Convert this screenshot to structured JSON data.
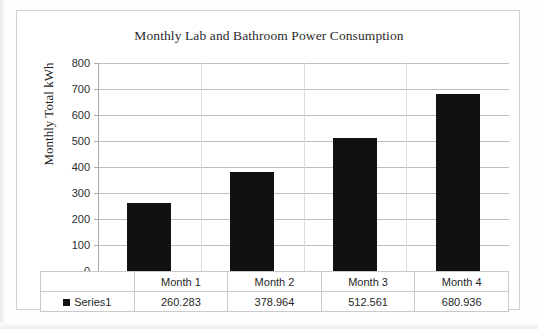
{
  "chart_data": {
    "type": "bar",
    "title": "Monthly Lab and Bathroom Power Consumption",
    "xlabel": "",
    "ylabel": "Monthly Total kWh",
    "categories": [
      "Month 1",
      "Month 2",
      "Month 3",
      "Month 4"
    ],
    "series": [
      {
        "name": "Series1",
        "values": [
          260.283,
          378.964,
          512.561,
          680.936
        ],
        "color": "#111111"
      }
    ],
    "value_labels": [
      "260.283",
      "378.964",
      "512.561",
      "680.936"
    ],
    "ylim": [
      0,
      800
    ],
    "ytick_labels": [
      "800",
      "700",
      "600",
      "500",
      "400",
      "300",
      "200",
      "100",
      "0"
    ],
    "ytick_values": [
      800,
      700,
      600,
      500,
      400,
      300,
      200,
      100,
      0
    ],
    "grid": true,
    "legend_position": "data-table",
    "has_data_table": true,
    "table": {
      "corner_label": "",
      "series_label": "Series1",
      "legend_marker": "black-square",
      "header_row": [
        "Month 1",
        "Month 2",
        "Month 3",
        "Month 4"
      ],
      "value_row": [
        "260.283",
        "378.964",
        "512.561",
        "680.936"
      ]
    }
  }
}
